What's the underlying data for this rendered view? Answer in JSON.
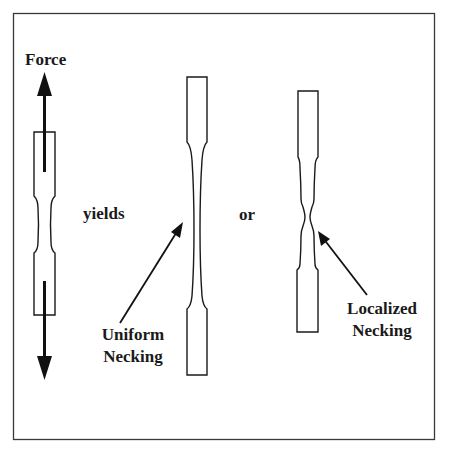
{
  "diagram": {
    "labels": {
      "force": "Force",
      "yields": "yields",
      "or": "or",
      "uniform_line1": "Uniform",
      "uniform_line2": "Necking",
      "localized_line1": "Localized",
      "localized_line2": "Necking"
    },
    "colors": {
      "stroke": "#1a1a1a",
      "frame": "#3a3a3a",
      "background": "#ffffff"
    },
    "nodes": [
      {
        "id": "original-specimen",
        "description": "Dog-bone tensile specimen under axial force"
      },
      {
        "id": "uniform-specimen",
        "description": "Specimen with uniform necking along gauge length"
      },
      {
        "id": "localized-specimen",
        "description": "Specimen with localized neck"
      }
    ],
    "edges": [
      {
        "from": "original-specimen",
        "to": "uniform-specimen",
        "label": "yields"
      },
      {
        "from": "original-specimen",
        "to": "localized-specimen",
        "label": "or"
      }
    ]
  }
}
